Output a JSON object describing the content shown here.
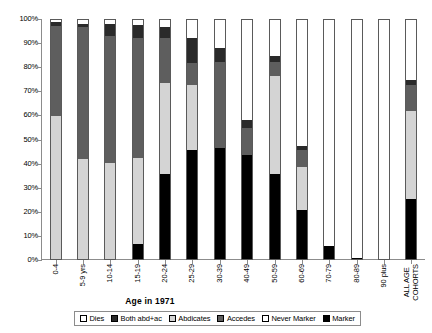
{
  "chart_data": {
    "type": "bar",
    "subtype": "stacked-100-percent",
    "title": "",
    "xlabel": "Age in 1971",
    "ylabel": "",
    "ylim": [
      0,
      100
    ],
    "ytick_labels": [
      "0%",
      "10%",
      "20%",
      "30%",
      "40%",
      "50%",
      "60%",
      "70%",
      "80%",
      "90%",
      "100%"
    ],
    "ytick_values": [
      0,
      10,
      20,
      30,
      40,
      50,
      60,
      70,
      80,
      90,
      100
    ],
    "grid": false,
    "legend_position": "bottom",
    "categories": [
      "0-4",
      "5-9 yrs",
      "10-14",
      "15-19",
      "20-24",
      "25-29",
      "30-39",
      "40-49",
      "50-59",
      "60-69",
      "70-79",
      "80-89",
      "90 plus",
      "ALL AGE\nCOHORTS"
    ],
    "stack_order_bottom_to_top": [
      "Marker",
      "Never Marker",
      "Abdicates",
      "Accedes",
      "Both abd+ac",
      "Dies"
    ],
    "series": [
      {
        "name": "Marker",
        "color": "#000000",
        "values": [
          0,
          0,
          0,
          6.5,
          35.5,
          45.5,
          46.5,
          43.5,
          35.5,
          20.5,
          5.5,
          0.5,
          0,
          25
        ]
      },
      {
        "name": "Never Marker",
        "color": "#ffffff",
        "values": [
          0,
          0,
          0,
          0,
          0,
          0,
          0,
          0,
          0,
          0,
          0,
          0,
          0,
          0
        ]
      },
      {
        "name": "Abdicates",
        "color": "#d4d4d4",
        "values": [
          60,
          42,
          40,
          38.5,
          38,
          27.5,
          0,
          0,
          41,
          18,
          0,
          0,
          0,
          37
        ]
      },
      {
        "name": "Accedes",
        "color": "#5e5e5e",
        "values": [
          37.5,
          55,
          53.5,
          53,
          19,
          9,
          36,
          11.5,
          6,
          7,
          0,
          0,
          0,
          11
        ]
      },
      {
        "name": "Both abd+ac",
        "color": "#2a2a2a",
        "values": [
          1.5,
          1.5,
          5,
          6,
          4.5,
          10.5,
          6,
          3,
          2.5,
          2,
          0,
          0,
          0,
          2
        ]
      },
      {
        "name": "Dies",
        "color": "#ffffff",
        "values": [
          1,
          1.5,
          1.5,
          2,
          3,
          7.5,
          11.5,
          42,
          15,
          52.5,
          94.5,
          99.5,
          100,
          25
        ]
      }
    ],
    "legend": [
      {
        "label": "Dies",
        "color": "#ffffff"
      },
      {
        "label": "Both  abd+ac",
        "color": "#2a2a2a"
      },
      {
        "label": "Abdicates",
        "color": "#d4d4d4"
      },
      {
        "label": "Accedes",
        "color": "#5e5e5e"
      },
      {
        "label": "Never Marker",
        "color": "#ffffff"
      },
      {
        "label": "Marker",
        "color": "#000000"
      }
    ]
  }
}
